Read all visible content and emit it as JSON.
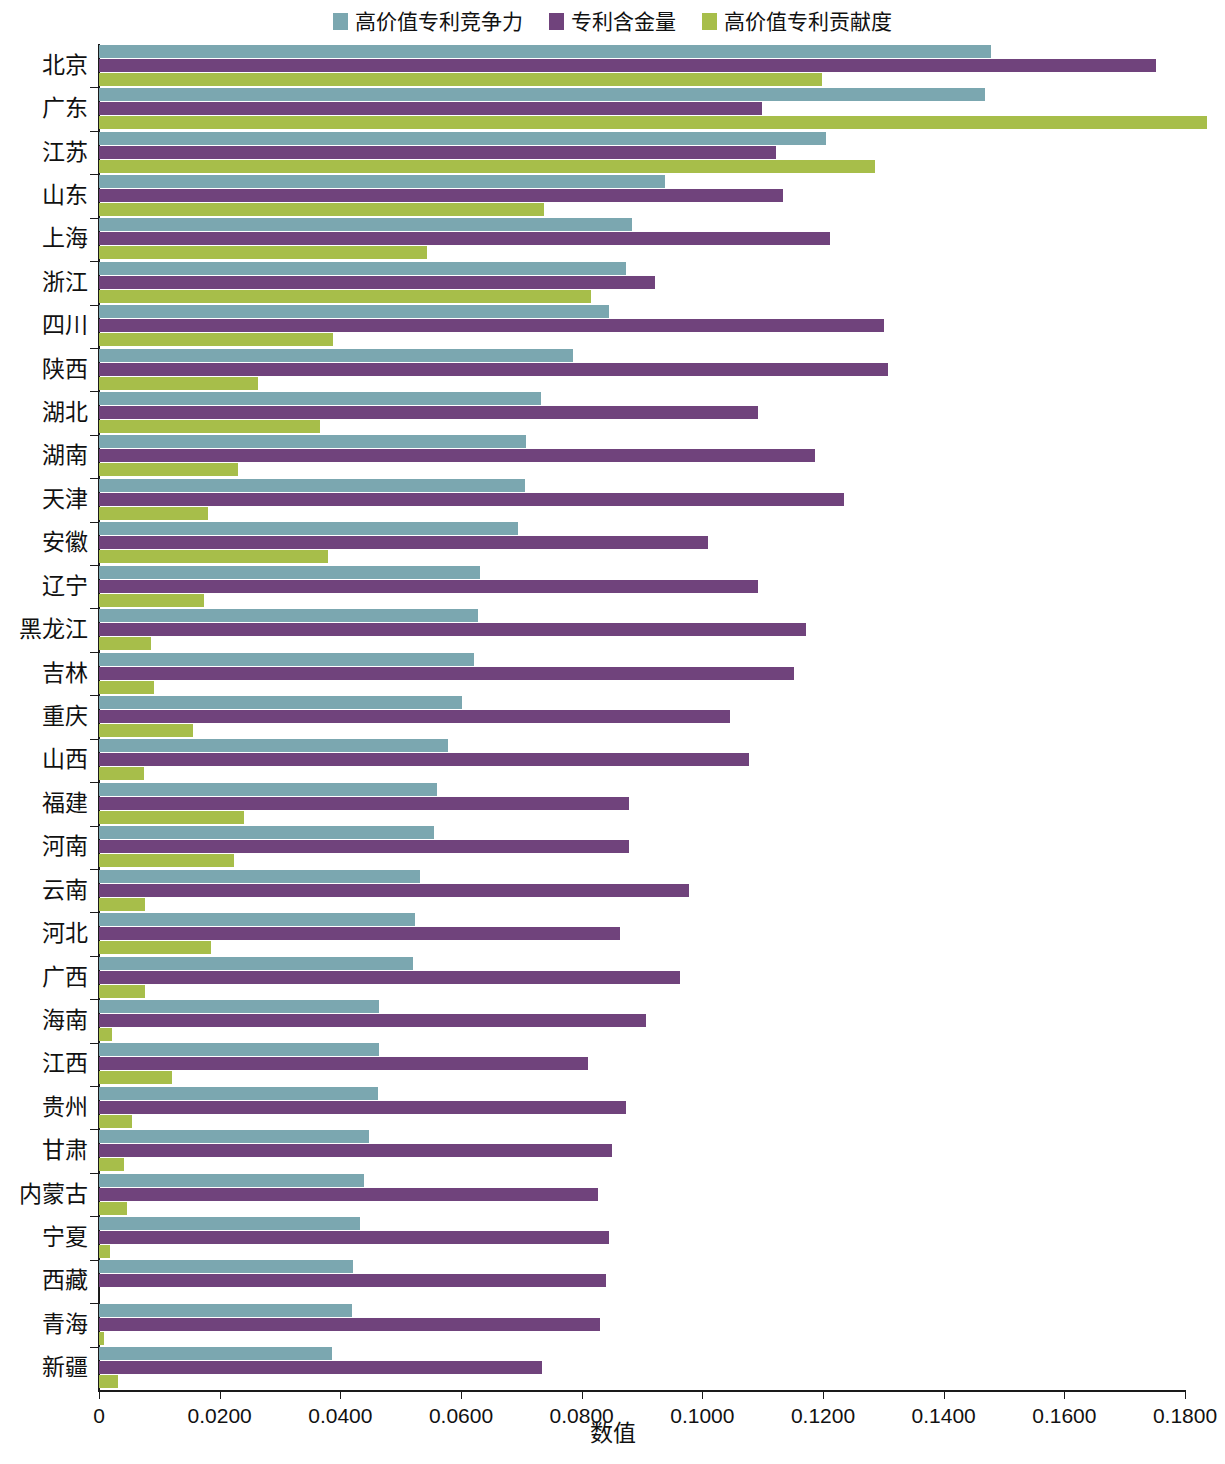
{
  "legend": {
    "position": "top-center",
    "items": [
      {
        "label": "高价值专利竞争力",
        "color": "#7BA7B0"
      },
      {
        "label": "专利含金量",
        "color": "#70437C"
      },
      {
        "label": "高价值专利贡献度",
        "color": "#A7BE4A"
      }
    ]
  },
  "axis": {
    "x_title": "数值",
    "x_ticks": [
      "0",
      "0.0200",
      "0.0400",
      "0.0600",
      "0.0800",
      "0.1000",
      "0.1200",
      "0.1400",
      "0.1600",
      "0.1800"
    ],
    "x_min": 0,
    "x_max": 0.18,
    "x_step": 0.02
  },
  "chart_data": {
    "type": "bar",
    "orientation": "horizontal",
    "title": "",
    "xlabel": "数值",
    "ylabel": "",
    "xlim": [
      0,
      0.18
    ],
    "grid": false,
    "legend_position": "top-center",
    "categories": [
      "北京",
      "广东",
      "江苏",
      "山东",
      "上海",
      "浙江",
      "四川",
      "陕西",
      "湖北",
      "湖南",
      "天津",
      "安徽",
      "辽宁",
      "黑龙江",
      "吉林",
      "重庆",
      "山西",
      "福建",
      "河南",
      "云南",
      "河北",
      "广西",
      "海南",
      "江西",
      "贵州",
      "甘肃",
      "内蒙古",
      "宁夏",
      "西藏",
      "青海",
      "新疆"
    ],
    "series": [
      {
        "name": "高价值专利竞争力",
        "color": "#7BA7B0",
        "values": [
          0.1478,
          0.1468,
          0.1205,
          0.0938,
          0.0884,
          0.0873,
          0.0845,
          0.0786,
          0.0733,
          0.0707,
          0.0706,
          0.0694,
          0.0631,
          0.0629,
          0.0621,
          0.0601,
          0.0578,
          0.056,
          0.0555,
          0.0532,
          0.0523,
          0.0521,
          0.0464,
          0.0464,
          0.0462,
          0.0447,
          0.0439,
          0.0432,
          0.0421,
          0.042,
          0.0387
        ]
      },
      {
        "name": "专利含金量",
        "color": "#70437C",
        "values": [
          0.1752,
          0.1099,
          0.1122,
          0.1133,
          0.1212,
          0.0922,
          0.1301,
          0.1308,
          0.1093,
          0.1186,
          0.1234,
          0.101,
          0.1092,
          0.1172,
          0.1152,
          0.1046,
          0.1077,
          0.0879,
          0.0879,
          0.0978,
          0.0864,
          0.0963,
          0.0906,
          0.0811,
          0.0874,
          0.085,
          0.0827,
          0.0845,
          0.084,
          0.083,
          0.0735
        ]
      },
      {
        "name": "高价值专利贡献度",
        "color": "#A7BE4A",
        "values": [
          0.1198,
          0.1836,
          0.1286,
          0.0738,
          0.0543,
          0.0816,
          0.0388,
          0.0263,
          0.0366,
          0.023,
          0.0181,
          0.0379,
          0.0174,
          0.0087,
          0.0091,
          0.0156,
          0.0074,
          0.0241,
          0.0224,
          0.0077,
          0.0186,
          0.0077,
          0.0022,
          0.0121,
          0.0055,
          0.0041,
          0.0046,
          0.0018,
          0.0,
          0.0008,
          0.0031
        ]
      }
    ]
  }
}
